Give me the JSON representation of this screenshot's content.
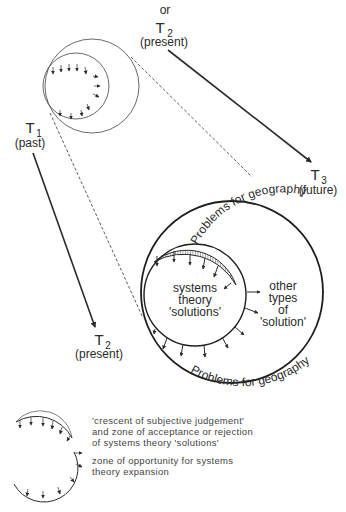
{
  "time_labels": {
    "t1": {
      "symbol": "T",
      "sub": "1",
      "desc": "(past)"
    },
    "t2_top": {
      "prefix": "or",
      "symbol": "T",
      "sub": "2",
      "desc": "(present)"
    },
    "t2_bottom": {
      "symbol": "T",
      "sub": "2",
      "desc": "(present)"
    },
    "t3": {
      "symbol": "T",
      "sub": "3",
      "desc": "(future)"
    }
  },
  "main_circle": {
    "arc_top": "Problems for geography",
    "arc_bottom": "Problems for geography",
    "inner_lines": [
      "systems",
      "theory",
      "'solutions'"
    ],
    "outer_lines": [
      "other",
      "types",
      "of",
      "'solution'"
    ]
  },
  "legend": {
    "items": [
      {
        "icon": "hatched-crescent-icon",
        "lines": [
          "'crescent of subjective judgement'",
          "and zone of acceptance or rejection",
          "of systems theory 'solutions'"
        ]
      },
      {
        "icon": "arrow-arc-icon",
        "lines": [
          "zone of opportunity for systems",
          "theory expansion"
        ]
      }
    ]
  },
  "colors": {
    "ink": "#2a2a2a",
    "paper": "#ffffff"
  }
}
